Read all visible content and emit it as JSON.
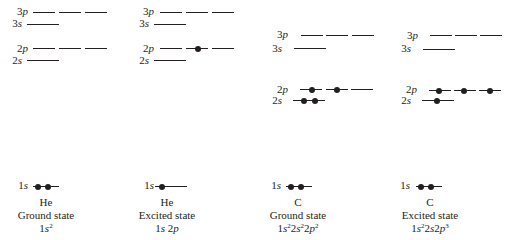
{
  "diagram": {
    "type": "orbital energy level diagram",
    "orbital_labels": {
      "3p": "3p",
      "3s": "3s",
      "2p": "2p",
      "2s": "2s",
      "1s": "1s"
    },
    "panels": [
      {
        "id": "he-ground",
        "element": "He",
        "state": "Ground state",
        "configuration": [
          {
            "n": "1",
            "l": "s",
            "e": "2"
          }
        ],
        "occupancy": {
          "1s": 2,
          "2s": 0,
          "2p": [
            0,
            0,
            0
          ],
          "3s": 0,
          "3p": [
            0,
            0,
            0
          ]
        }
      },
      {
        "id": "he-excited",
        "element": "He",
        "state": "Excited state",
        "configuration": [
          {
            "n": "1",
            "l": "s",
            "e": ""
          },
          {
            "n": "2",
            "l": "p",
            "e": ""
          }
        ],
        "occupancy": {
          "1s": 1,
          "2s": 0,
          "2p": [
            0,
            1,
            0
          ],
          "3s": 0,
          "3p": [
            0,
            0,
            0
          ]
        }
      },
      {
        "id": "c-ground",
        "element": "C",
        "state": "Ground state",
        "configuration": [
          {
            "n": "1",
            "l": "s",
            "e": "2"
          },
          {
            "n": "2",
            "l": "s",
            "e": "2"
          },
          {
            "n": "2",
            "l": "p",
            "e": "2"
          }
        ],
        "occupancy": {
          "1s": 2,
          "2s": 2,
          "2p": [
            1,
            1,
            0
          ],
          "3s": 0,
          "3p": [
            0,
            0,
            0
          ]
        }
      },
      {
        "id": "c-excited",
        "element": "C",
        "state": "Excited state",
        "configuration": [
          {
            "n": "1",
            "l": "s",
            "e": "2"
          },
          {
            "n": "2",
            "l": "s",
            "e": ""
          },
          {
            "n": "2",
            "l": "p",
            "e": "3"
          }
        ],
        "occupancy": {
          "1s": 2,
          "2s": 1,
          "2p": [
            1,
            1,
            1
          ],
          "3s": 0,
          "3p": [
            0,
            0,
            0
          ]
        }
      }
    ],
    "captions": [
      {
        "element": "He",
        "state": "Ground state",
        "config_text": "1s2"
      },
      {
        "element": "He",
        "state": "Excited state",
        "config_text": "1s 2p"
      },
      {
        "element": "C",
        "state": "Ground state",
        "config_text": "1s22s22p2"
      },
      {
        "element": "C",
        "state": "Excited state",
        "config_text": "1s22s2p3"
      }
    ]
  }
}
